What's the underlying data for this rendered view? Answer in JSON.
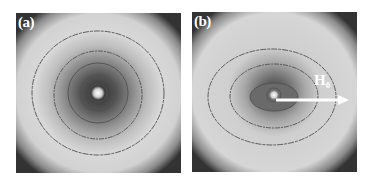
{
  "figure": {
    "panels": [
      {
        "id": "a",
        "label": "(a)",
        "description": "Concentric, nearly circular contour rings around a bright central spot"
      },
      {
        "id": "b",
        "label": "(b)",
        "description": "Horizontally elongated elliptical contours with an arrow pointing right",
        "arrow": {
          "label": "H",
          "subscript": "0",
          "direction": "right"
        }
      }
    ],
    "colors": {
      "background": "#ffffff",
      "corner_dark": "#3a3a3a",
      "field_light": "#d6d6d6",
      "contour_line": "#505050",
      "center_dark": "#4a4a4a",
      "center_spot": "#f4f4f4",
      "text": "#ffffff"
    }
  }
}
